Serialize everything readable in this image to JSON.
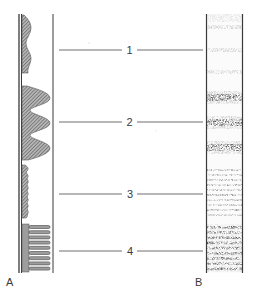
{
  "figure": {
    "panels": [
      {
        "id": "A",
        "label": "A",
        "description": "profile / trace column"
      },
      {
        "id": "B",
        "label": "B",
        "description": "band column"
      }
    ],
    "markers": [
      {
        "label": "1",
        "y": 50
      },
      {
        "label": "2",
        "y": 122
      },
      {
        "label": "3",
        "y": 195
      },
      {
        "label": "4",
        "y": 252
      }
    ]
  },
  "colors": {
    "ink": "#3a3a3a",
    "hatch": "#7a7a7a",
    "background": "#ffffff"
  }
}
